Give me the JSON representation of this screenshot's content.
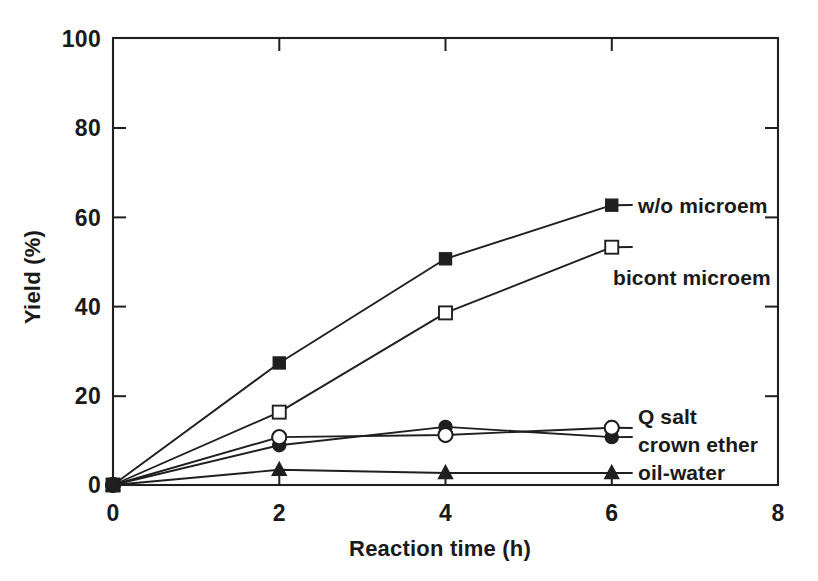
{
  "chart_data": {
    "type": "line",
    "title": "",
    "xlabel": "Reaction time  (h)",
    "ylabel": "Yield (%)",
    "xlim": [
      0,
      8
    ],
    "ylim": [
      0,
      100
    ],
    "xticks": [
      0,
      2,
      4,
      6,
      8
    ],
    "xtick_labels": [
      "0",
      "2",
      "4",
      "6",
      "8"
    ],
    "yticks": [
      0,
      20,
      40,
      60,
      80,
      100
    ],
    "ytick_labels": [
      "0",
      "20",
      "40",
      "60",
      "80",
      "100"
    ],
    "grid": false,
    "legend_position": "inline-right-of-endpoints",
    "x": [
      0,
      2,
      4,
      6
    ],
    "series": [
      {
        "name": "w/o microem",
        "label": "w/o microem",
        "marker": "filled-square",
        "values": [
          0,
          27.3,
          50.6,
          62.6
        ]
      },
      {
        "name": "bicont microem",
        "label": "bicont microem",
        "marker": "open-square",
        "values": [
          0,
          16.3,
          38.5,
          53.2
        ]
      },
      {
        "name": "Q salt",
        "label": "Q salt",
        "marker": "filled-circle",
        "values": [
          0,
          8.9,
          13.0,
          10.7
        ]
      },
      {
        "name": "crown ether",
        "label": "crown ether",
        "marker": "open-circle",
        "values": [
          0,
          10.7,
          11.2,
          12.8
        ]
      },
      {
        "name": "oil-water",
        "label": "oil-water",
        "marker": "filled-triangle",
        "values": [
          0,
          3.4,
          2.7,
          2.7
        ]
      }
    ]
  },
  "axis": {
    "x_title": "Reaction time  (h)",
    "y_title": "Yield (%)",
    "x_tick_labels": [
      "0",
      "2",
      "4",
      "6",
      "8"
    ],
    "y_tick_labels": [
      "0",
      "20",
      "40",
      "60",
      "80",
      "100"
    ]
  },
  "annotations": {
    "label_w_o_microem": "w/o microem",
    "label_bicont_microem": "bicont microem",
    "label_q_salt": "Q salt",
    "label_crown_ether": "crown ether",
    "label_oil_water": "oil-water"
  },
  "colors": {
    "ink": "#1f1f1f",
    "background": "#ffffff",
    "marker_fill_open": "#ffffff"
  }
}
